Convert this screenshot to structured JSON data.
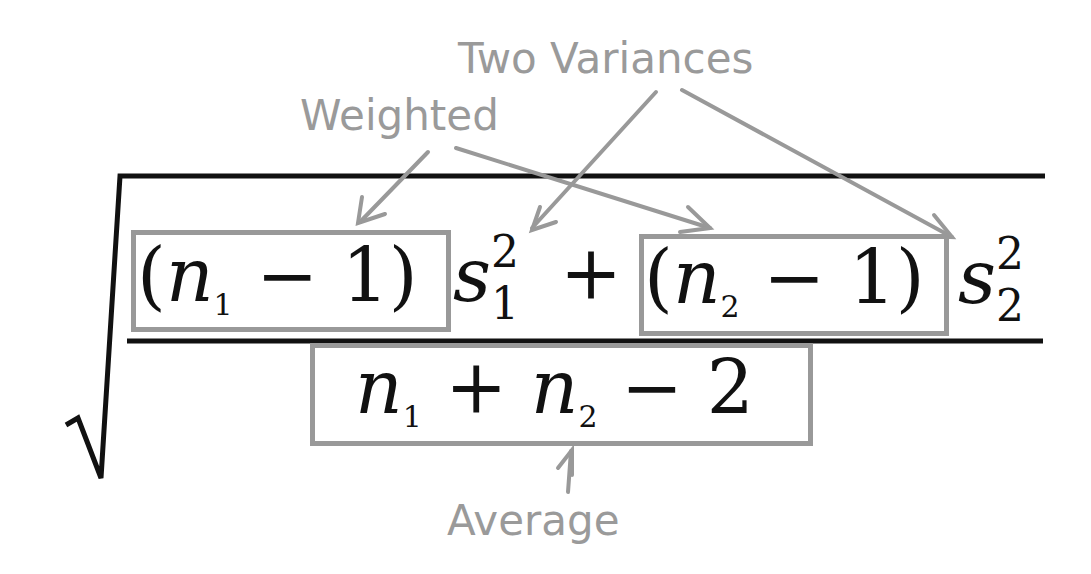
{
  "labels": {
    "two_variances": "Two Variances",
    "weighted": "Weighted",
    "average": "Average"
  },
  "formula": {
    "numerator_term1": {
      "open": "(",
      "var": "n",
      "sub": "1",
      "op": " − ",
      "const": "1",
      "close": ")"
    },
    "s1": {
      "var": "s",
      "sup": "2",
      "sub": "1"
    },
    "plus": "+",
    "numerator_term2": {
      "open": "(",
      "var": "n",
      "sub": "2",
      "op": " − ",
      "const": "1",
      "close": ")"
    },
    "s2": {
      "var": "s",
      "sup": "2",
      "sub": "2"
    },
    "denominator": {
      "var1": "n",
      "sub1": "1",
      "op1": " + ",
      "var2": "n",
      "sub2": "2",
      "op2": " − ",
      "const": "2"
    }
  },
  "colors": {
    "ink": "#111111",
    "annotation": "#999999"
  }
}
